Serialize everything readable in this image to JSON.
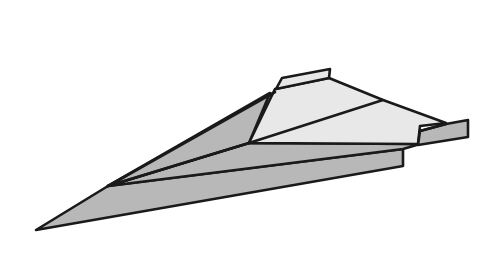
{
  "illustration": {
    "subject": "paper airplane",
    "colors": {
      "background": "#ffffff",
      "shaded_panel": "#b8b8b8",
      "light_panel": "#e8e8e8",
      "outline": "#1a1a1a"
    }
  }
}
